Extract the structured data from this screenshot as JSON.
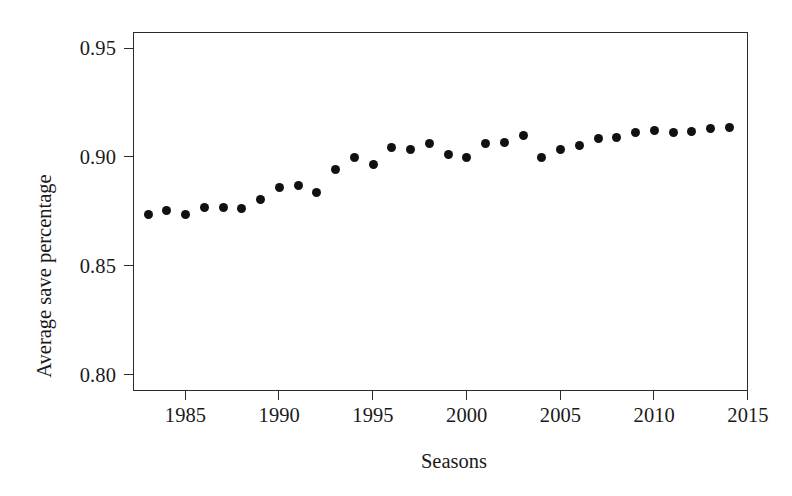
{
  "chart_data": {
    "type": "scatter",
    "title": "",
    "xlabel": "Seasons",
    "ylabel": "Average save percentage",
    "xlim": [
      1982.2,
      2015.0
    ],
    "ylim": [
      0.7925,
      0.9575
    ],
    "grid": false,
    "legend": "none",
    "marker": "filled-circle",
    "marker_color": "#111111",
    "xticks": [
      1985,
      1990,
      1995,
      2000,
      2005,
      2010,
      2015
    ],
    "xtick_labels": [
      "1985",
      "1990",
      "1995",
      "2000",
      "2005",
      "2010",
      "2015"
    ],
    "yticks": [
      0.8,
      0.85,
      0.9,
      0.95
    ],
    "ytick_labels": [
      "0.80",
      "0.85",
      "0.90",
      "0.95"
    ],
    "x": [
      1983,
      1984,
      1985,
      1986,
      1987,
      1988,
      1989,
      1990,
      1991,
      1992,
      1993,
      1994,
      1995,
      1996,
      1997,
      1998,
      1999,
      2000,
      2001,
      2002,
      2003,
      2004,
      2005,
      2006,
      2007,
      2008,
      2009,
      2010,
      2011,
      2012,
      2013,
      2014
    ],
    "values": [
      0.8735,
      0.8753,
      0.8735,
      0.8767,
      0.8767,
      0.8762,
      0.8803,
      0.8862,
      0.8871,
      0.8839,
      0.8944,
      0.8999,
      0.8967,
      0.9044,
      0.9035,
      0.9063,
      0.9013,
      0.8999,
      0.9063,
      0.9067,
      0.9099,
      0.8999,
      0.9035,
      0.9053,
      0.9085,
      0.909,
      0.9112,
      0.9121,
      0.9112,
      0.9117,
      0.913,
      0.9135
    ]
  },
  "axes": {
    "x_title": "Seasons",
    "y_title": "Average save percentage"
  },
  "colors": {
    "marker": "#111111",
    "axis": "#2b2b2b",
    "text": "#1a1a1a",
    "background": "#ffffff"
  }
}
